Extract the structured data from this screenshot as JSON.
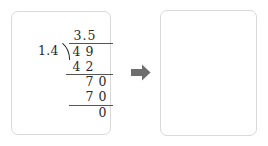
{
  "diagram": {
    "type": "long-division-worked-example",
    "arrow": {
      "icon": "arrow-right-icon",
      "direction": "right",
      "color": "#6e6e6e"
    },
    "panels": [
      {
        "id": "solved",
        "label": "completed-long-division",
        "quotient": {
          "integer": "3",
          "decimal_point": ".",
          "fraction": "5",
          "full": "3.5"
        },
        "divisor": "1.4",
        "dividend_digits": [
          "4",
          "9"
        ],
        "dividend": "49",
        "steps": [
          {
            "name": "first-product",
            "digits": [
              "4",
              "2"
            ],
            "value": "42"
          },
          {
            "name": "first-remainder",
            "digits": [
              "7",
              "0"
            ],
            "value": "70"
          },
          {
            "name": "second-product",
            "digits": [
              "7",
              "0"
            ],
            "value": "70"
          },
          {
            "name": "final-remainder",
            "digits": [
              "0"
            ],
            "value": "0"
          }
        ],
        "rules": [
          "vinculum",
          "subtraction-line-1",
          "subtraction-line-2"
        ]
      },
      {
        "id": "setup",
        "label": "long-division-setup",
        "divisor": "1.4",
        "dividend_digits": [
          "4",
          "9"
        ],
        "dividend": "49",
        "quotient": "",
        "steps": [],
        "rules": [
          "vinculum"
        ]
      }
    ],
    "colors": {
      "panel_background": "#ffffff",
      "panel_border": "#d9d9d9",
      "text": "#2b2b2b",
      "rule": "#555555",
      "arrow": "#6e6e6e",
      "page_background": "#ffffff"
    }
  }
}
